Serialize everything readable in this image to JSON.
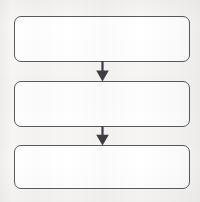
{
  "diagram": {
    "kind": "flowchart",
    "orientation": "vertical",
    "title": "",
    "background_color": "#f7f6f4",
    "stroke_color": "#5a5a5e",
    "node_fill_color": "#ffffff",
    "arrow_color": "#3f3f43",
    "nodes": [
      {
        "id": "node-1",
        "label": "",
        "shape": "rounded-rectangle",
        "x": 14,
        "y": 16,
        "width": 176,
        "height": 46
      },
      {
        "id": "node-2",
        "label": "",
        "shape": "rounded-rectangle",
        "x": 14,
        "y": 81,
        "width": 176,
        "height": 46
      },
      {
        "id": "node-3",
        "label": "",
        "shape": "rounded-rectangle",
        "x": 14,
        "y": 145,
        "width": 176,
        "height": 44
      }
    ],
    "connectors": [
      {
        "id": "connector-1",
        "from": "node-1",
        "to": "node-2",
        "label": "",
        "direction": "down",
        "x": 102,
        "y_start": 62,
        "y_end": 81
      },
      {
        "id": "connector-2",
        "from": "node-2",
        "to": "node-3",
        "label": "",
        "direction": "down",
        "x": 102,
        "y_start": 127,
        "y_end": 145
      }
    ]
  }
}
